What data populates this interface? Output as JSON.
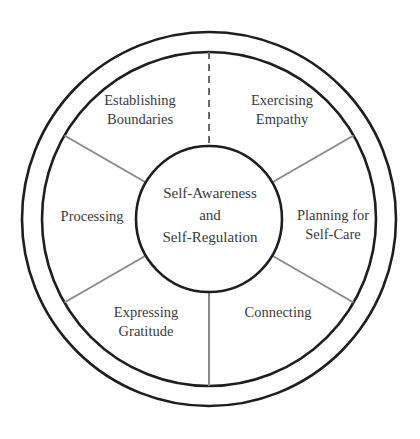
{
  "diagram": {
    "type": "wheel",
    "center": {
      "line1": "Self-Awareness",
      "line2": "and",
      "line3": "Self-Regulation"
    },
    "segments": [
      {
        "id": "exercising-empathy",
        "line1": "Exercising",
        "line2": "Empathy"
      },
      {
        "id": "planning-for-self-care",
        "line1": "Planning for",
        "line2": "Self-Care"
      },
      {
        "id": "connecting",
        "line1": "Connecting",
        "line2": ""
      },
      {
        "id": "expressing-gratitude",
        "line1": "Expressing",
        "line2": "Gratitude"
      },
      {
        "id": "processing",
        "line1": "Processing",
        "line2": ""
      },
      {
        "id": "establishing-boundaries",
        "line1": "Establishing",
        "line2": "Boundaries"
      }
    ],
    "colors": {
      "ring": "#1e1e1e",
      "spoke": "#8a8a8a",
      "text": "#3a3a3a"
    }
  }
}
